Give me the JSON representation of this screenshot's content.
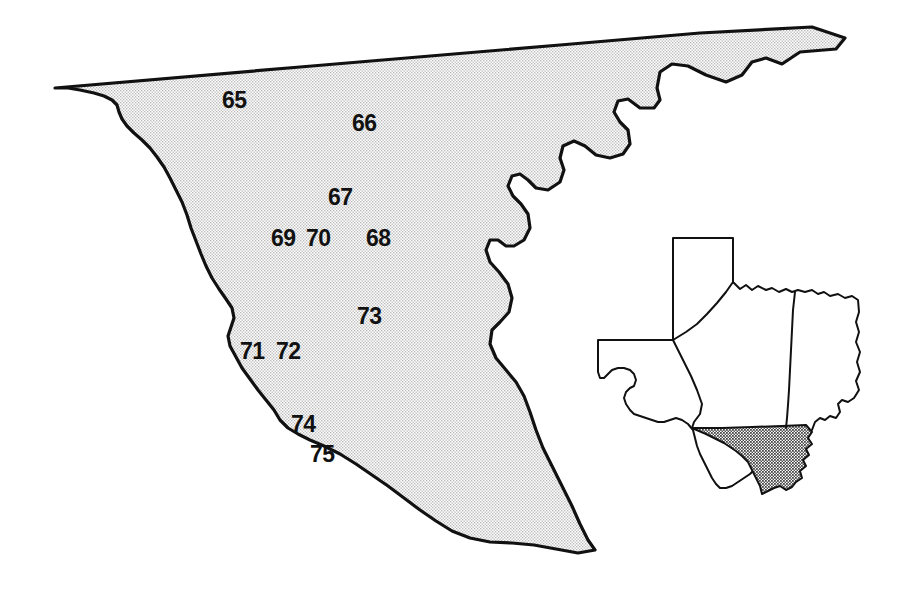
{
  "figure": {
    "width": 919,
    "height": 598,
    "background_color": "#ffffff",
    "outline_color": "#111111",
    "fill_pattern_color": "#e3e3e3",
    "label_color": "#111111"
  },
  "main_map": {
    "name": "south-texas-region-map",
    "fill_label": "stippled-gray",
    "labels": [
      {
        "text": "65",
        "x": 222,
        "y": 89
      },
      {
        "text": "66",
        "x": 352,
        "y": 112
      },
      {
        "text": "67",
        "x": 328,
        "y": 186
      },
      {
        "text": "69",
        "x": 271,
        "y": 227
      },
      {
        "text": "70",
        "x": 306,
        "y": 227
      },
      {
        "text": "68",
        "x": 366,
        "y": 227
      },
      {
        "text": "73",
        "x": 357,
        "y": 305
      },
      {
        "text": "71",
        "x": 240,
        "y": 340
      },
      {
        "text": "72",
        "x": 276,
        "y": 340
      },
      {
        "text": "74",
        "x": 291,
        "y": 413
      },
      {
        "text": "75",
        "x": 310,
        "y": 443
      }
    ]
  },
  "inset_map": {
    "name": "texas-state-inset",
    "state_label": "Texas",
    "highlighted_region_label": "South Texas",
    "highlight_fill": "#9b9b9b",
    "state_fill": "#ffffff"
  },
  "icons": {
    "map-outline-icon": "map-outline",
    "inset-map-icon": "state-inset"
  }
}
